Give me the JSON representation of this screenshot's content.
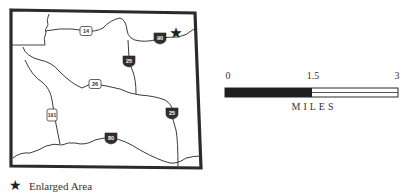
{
  "map": {
    "routes": [
      {
        "id": "us-14",
        "type": "us-highway",
        "label": "14"
      },
      {
        "id": "i-90",
        "type": "interstate",
        "label": "90"
      },
      {
        "id": "i-25-north",
        "type": "interstate",
        "label": "25"
      },
      {
        "id": "us-26",
        "type": "us-highway",
        "label": "26"
      },
      {
        "id": "us-191",
        "type": "us-highway",
        "label": "191"
      },
      {
        "id": "i-25-south",
        "type": "interstate",
        "label": "25"
      },
      {
        "id": "i-80",
        "type": "interstate",
        "label": "80"
      }
    ],
    "marker": {
      "symbol": "★",
      "meaning": "Enlarged Area"
    }
  },
  "scale_bar": {
    "ticks": [
      "0",
      "1.5",
      "3"
    ],
    "unit_label": "MILES"
  },
  "legend": {
    "symbol": "★",
    "label": "Enlarged Area"
  },
  "colors": {
    "border": "#2b2b2b",
    "road": "#3a3a3a",
    "interstate_shield": "#2f2f2f",
    "scale_fill": "#1f1f1f"
  }
}
